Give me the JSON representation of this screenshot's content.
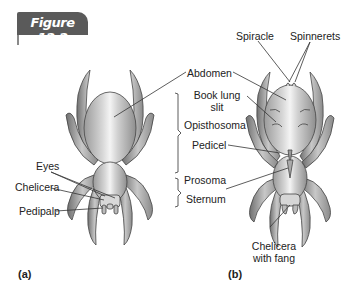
{
  "figure": {
    "title": "Figure 12.2",
    "banner_color": "#5a5a5a"
  },
  "panel_a": {
    "tag": "(a)",
    "labels": {
      "eyes": "Eyes",
      "chelicera": "Chelicera",
      "pedipalp": "Pedipalp"
    }
  },
  "shared_labels": {
    "abdomen": "Abdomen",
    "book_lung_line1": "Book lung",
    "book_lung_line2": "slit",
    "opisthosoma": "Opisthosoma",
    "pedicel": "Pedicel",
    "prosoma": "Prosoma",
    "sternum": "Sternum"
  },
  "panel_b": {
    "tag": "(b)",
    "labels": {
      "spiracle": "Spiracle",
      "spinnerets": "Spinnerets",
      "chelicera_line1": "Chelicera",
      "chelicera_line2": "with fang"
    }
  }
}
